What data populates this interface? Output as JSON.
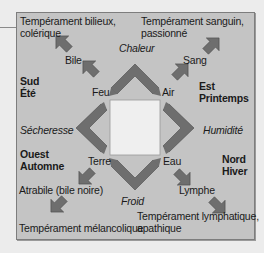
{
  "diagram": {
    "title_hidden": "",
    "colors": {
      "background": "#ececec",
      "frame_fill": "#c4c4c4",
      "frame_border": "#7d7d7d",
      "arrow_fill": "#6e6e6e",
      "center_fill": "#efefef"
    },
    "temperaments": {
      "top_left": [
        "Tempérament bilieux,",
        "colérique"
      ],
      "top_right": [
        "Tempérament sanguin,",
        "passionné"
      ],
      "bottom_left": [
        "Tempérament mélancolique"
      ],
      "bottom_right": [
        "Tempérament lymphatique,",
        "apathique"
      ]
    },
    "humors": {
      "top_left": "Bile",
      "top_right": "Sang",
      "bottom_left": "Atrabile (bile noire)",
      "bottom_right": "Lymphe"
    },
    "elements": {
      "top_left": "Feu",
      "top_right": "Air",
      "bottom_left": "Terre",
      "bottom_right": "Eau"
    },
    "qualities": {
      "top": "Chaleur",
      "right": "Humidité",
      "bottom": "Froid",
      "left": "Sécheresse"
    },
    "directions_seasons": {
      "south": [
        "Sud",
        "Été"
      ],
      "east": [
        "Est",
        "Printemps"
      ],
      "west": [
        "Ouest",
        "Automne"
      ],
      "north": [
        "Nord",
        "Hiver"
      ]
    },
    "icons": {
      "chevron": "chevron-arrow-icon",
      "diagonal": "diagonal-arrow-icon"
    }
  }
}
